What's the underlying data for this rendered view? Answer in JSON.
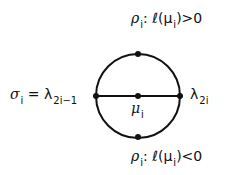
{
  "labels": {
    "top": {
      "rho": "ρ",
      "sub": "i",
      "text": ": ℓ(μ",
      "sub2": "i",
      "tail": ")>0"
    },
    "bottom": {
      "rho": "ρ",
      "sub": "i",
      "text": ": ℓ(μ",
      "sub2": "i",
      "tail": ")<0"
    },
    "left": {
      "sigma": "σ",
      "sub": "i",
      "eq": " = λ",
      "sub2": "2i−1"
    },
    "right": {
      "lambda": "λ",
      "sub": "2i"
    },
    "center": {
      "mu": "μ",
      "sub": "i"
    }
  },
  "colors": {
    "stroke": "#111111"
  }
}
